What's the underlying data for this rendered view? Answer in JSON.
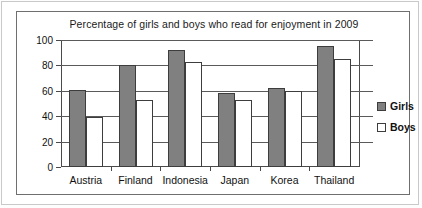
{
  "chart_data": {
    "type": "bar",
    "title": "Percentage of girls and boys who read for enjoyment in 2009",
    "xlabel": "",
    "ylabel": "",
    "ylim": [
      0,
      100
    ],
    "ytick_values": [
      0,
      20,
      40,
      60,
      80,
      100
    ],
    "ytick_labels": [
      "0",
      "20",
      "40",
      "60",
      "80",
      "100"
    ],
    "grid": true,
    "legend_position": "right",
    "categories": [
      "Austria",
      "Finland",
      "Indonesia",
      "Japan",
      "Korea",
      "Thailand"
    ],
    "series": [
      {
        "name": "Girls",
        "color": "#808080",
        "values": [
          61,
          80,
          92,
          58,
          62,
          95
        ]
      },
      {
        "name": "Boys",
        "color": "#ffffff",
        "values": [
          39,
          53,
          83,
          53,
          60,
          85
        ]
      }
    ]
  },
  "legend": {
    "entries": [
      {
        "label": "Girls",
        "swatch": "girls"
      },
      {
        "label": "Boys",
        "swatch": "boys"
      }
    ]
  }
}
